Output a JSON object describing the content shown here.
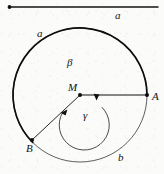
{
  "figure": {
    "background_color": "#fbfbfa",
    "ink_color": "#111111",
    "scale_bar": {
      "label": "a",
      "x1": 8,
      "y1": 7,
      "x2": 158,
      "y2": 7,
      "endpoint_dot": {
        "x": 9,
        "y": 7
      }
    },
    "center_point": {
      "label": "M",
      "x": 80,
      "y": 95
    },
    "outer_circle": {
      "label_upper_left": "a",
      "label_lower_right": "b",
      "cx": 80,
      "cy": 95,
      "r": 67,
      "stroke_width_thick": 1.6,
      "stroke_width_thin": 0.7
    },
    "inner_arc": {
      "label_upper": "β",
      "label_lower": "γ",
      "cx": 80,
      "cy": 95,
      "r": 25,
      "stroke_width": 0.8
    },
    "points": [
      {
        "label": "A",
        "x": 147,
        "y": 95,
        "on": "outer-circle",
        "ray_from": "M"
      },
      {
        "label": "B",
        "x": 32,
        "y": 140,
        "on": "outer-circle",
        "ray_from": "M"
      }
    ],
    "rays": [
      {
        "name": "ray-MA",
        "x1": 80,
        "y1": 95,
        "x2": 147,
        "y2": 95
      },
      {
        "name": "ray-MB",
        "x1": 80,
        "y1": 95,
        "x2": 32,
        "y2": 140
      }
    ],
    "angle_arrowheads": [
      {
        "name": "gamma-arrowhead-at-MA",
        "x": 96,
        "y": 99
      },
      {
        "name": "gamma-arrowhead-at-MB",
        "x": 62,
        "y": 111
      }
    ]
  }
}
